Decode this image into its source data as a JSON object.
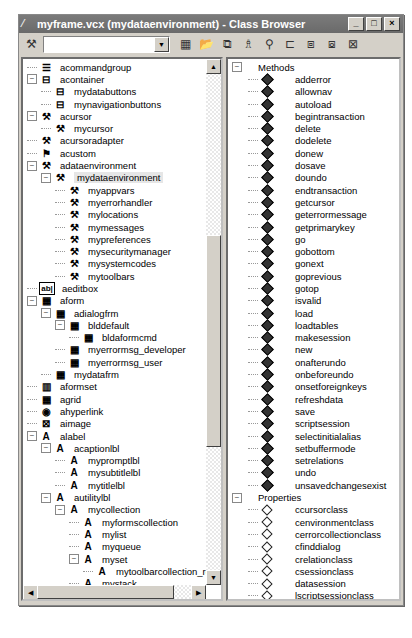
{
  "window": {
    "title": "myframe.vcx (mydataenvironment) - Class Browser",
    "controls": {
      "minimize": "_",
      "maximize": "□",
      "close": "×"
    }
  },
  "toolbar": {
    "combo_value": "",
    "icons": [
      "component-gallery-icon",
      "open-icon",
      "view-additional-icon",
      "class-icon",
      "find-icon",
      "redefine-icon",
      "copy-icon",
      "paste-icon",
      "clean-up-icon"
    ]
  },
  "left_tree": [
    {
      "label": "acommandgroup",
      "depth": 0,
      "icon": "commandgroup",
      "exp": null
    },
    {
      "label": "acontainer",
      "depth": 0,
      "icon": "container",
      "exp": "-"
    },
    {
      "label": "mydatabuttons",
      "depth": 1,
      "icon": "container",
      "exp": null
    },
    {
      "label": "mynavigationbuttons",
      "depth": 1,
      "icon": "container",
      "exp": null
    },
    {
      "label": "acursor",
      "depth": 0,
      "icon": "custom",
      "exp": "-"
    },
    {
      "label": "mycursor",
      "depth": 1,
      "icon": "custom",
      "exp": null
    },
    {
      "label": "acursoradapter",
      "depth": 0,
      "icon": "custom",
      "exp": null
    },
    {
      "label": "acustom",
      "depth": 0,
      "icon": "custom2",
      "exp": null
    },
    {
      "label": "adataenvironment",
      "depth": 0,
      "icon": "custom",
      "exp": "-"
    },
    {
      "label": "mydataenvironment",
      "depth": 1,
      "icon": "custom",
      "exp": "-",
      "selected": true
    },
    {
      "label": "myappvars",
      "depth": 2,
      "icon": "custom",
      "exp": null
    },
    {
      "label": "myerrorhandler",
      "depth": 2,
      "icon": "custom",
      "exp": null
    },
    {
      "label": "mylocations",
      "depth": 2,
      "icon": "custom",
      "exp": null
    },
    {
      "label": "mymessages",
      "depth": 2,
      "icon": "custom",
      "exp": null
    },
    {
      "label": "mypreferences",
      "depth": 2,
      "icon": "custom",
      "exp": null
    },
    {
      "label": "mysecuritymanager",
      "depth": 2,
      "icon": "custom",
      "exp": null
    },
    {
      "label": "mysystemcodes",
      "depth": 2,
      "icon": "custom",
      "exp": null
    },
    {
      "label": "mytoolbars",
      "depth": 2,
      "icon": "custom",
      "exp": null
    },
    {
      "label": "aeditbox",
      "depth": 0,
      "icon": "editbox",
      "exp": null
    },
    {
      "label": "aform",
      "depth": 0,
      "icon": "form",
      "exp": "-"
    },
    {
      "label": "adialogfrm",
      "depth": 1,
      "icon": "form",
      "exp": "-"
    },
    {
      "label": "blddefault",
      "depth": 2,
      "icon": "form",
      "exp": "-"
    },
    {
      "label": "bldaformcmd",
      "depth": 3,
      "icon": "form",
      "exp": null
    },
    {
      "label": "myerrormsg_developer",
      "depth": 2,
      "icon": "form",
      "exp": null
    },
    {
      "label": "myerrormsg_user",
      "depth": 2,
      "icon": "form",
      "exp": null
    },
    {
      "label": "mydatafrm",
      "depth": 1,
      "icon": "form",
      "exp": null
    },
    {
      "label": "aformset",
      "depth": 0,
      "icon": "formset",
      "exp": null
    },
    {
      "label": "agrid",
      "depth": 0,
      "icon": "grid",
      "exp": null
    },
    {
      "label": "ahyperlink",
      "depth": 0,
      "icon": "hyperlink",
      "exp": null
    },
    {
      "label": "aimage",
      "depth": 0,
      "icon": "image",
      "exp": null
    },
    {
      "label": "alabel",
      "depth": 0,
      "icon": "label",
      "exp": "-"
    },
    {
      "label": "acaptionlbl",
      "depth": 1,
      "icon": "label",
      "exp": "-"
    },
    {
      "label": "mypromptlbl",
      "depth": 2,
      "icon": "label",
      "exp": null
    },
    {
      "label": "mysubtitlelbl",
      "depth": 2,
      "icon": "label",
      "exp": null
    },
    {
      "label": "mytitlelbl",
      "depth": 2,
      "icon": "label",
      "exp": null
    },
    {
      "label": "autilitylbl",
      "depth": 1,
      "icon": "label",
      "exp": "-"
    },
    {
      "label": "mycollection",
      "depth": 2,
      "icon": "label",
      "exp": "-"
    },
    {
      "label": "myformscollection",
      "depth": 3,
      "icon": "label",
      "exp": null
    },
    {
      "label": "mylist",
      "depth": 3,
      "icon": "label",
      "exp": null
    },
    {
      "label": "myqueue",
      "depth": 3,
      "icon": "label",
      "exp": null
    },
    {
      "label": "myset",
      "depth": 3,
      "icon": "label",
      "exp": "-"
    },
    {
      "label": "mytoolbarcollection_remov",
      "depth": 4,
      "icon": "label",
      "exp": null
    },
    {
      "label": "mystack",
      "depth": 3,
      "icon": "label",
      "exp": null
    },
    {
      "label": "aline",
      "depth": 0,
      "icon": "line",
      "exp": null
    },
    {
      "label": "alistbox",
      "depth": 0,
      "icon": "listbox",
      "exp": "-"
    },
    {
      "label": "mychecklist",
      "depth": 1,
      "icon": "listbox",
      "exp": null
    },
    {
      "label": "mynavlist",
      "depth": 1,
      "icon": "listbox",
      "exp": null
    }
  ],
  "right_tree": {
    "methods_label": "Methods",
    "methods": [
      "adderror",
      "allownav",
      "autoload",
      "begintransaction",
      "delete",
      "dodelete",
      "donew",
      "dosave",
      "doundo",
      "endtransaction",
      "getcursor",
      "geterrormessage",
      "getprimarykey",
      "go",
      "gobottom",
      "gonext",
      "goprevious",
      "gotop",
      "isvalid",
      "load",
      "loadtables",
      "makesession",
      "new",
      "onafterundo",
      "onbeforeundo",
      "onsetforeignkeys",
      "refreshdata",
      "save",
      "scriptsession",
      "selectinitialalias",
      "setbuffermode",
      "setrelations",
      "undo",
      "unsavedchangesexist"
    ],
    "properties_label": "Properties",
    "properties": [
      "ccursorclass",
      "cenvironmentclass",
      "cerrorcollectionclass",
      "cfinddialog",
      "crelationclass",
      "csessionclass",
      "datasession",
      "lscriptsessionclass",
      "nbuffermode",
      "oerrorcollection",
      "oprimarycursor",
      "osession"
    ]
  }
}
